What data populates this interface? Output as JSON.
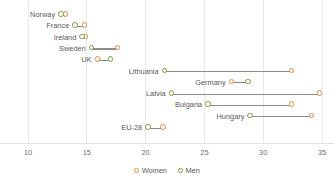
{
  "chart_data": {
    "type": "scatter",
    "title": "",
    "subtitle": "",
    "xlabel": "",
    "ylabel": "",
    "xlim": [
      9.2,
      35.5
    ],
    "grid": true,
    "legend_position": "bottom-center",
    "xticks": [
      10,
      15,
      20,
      25,
      30,
      35
    ],
    "xtick_labels": [
      "10",
      "15",
      "20",
      "25",
      "30",
      "35"
    ],
    "series": [
      {
        "name": "Women",
        "color": "#e8883a",
        "values": [
          13.2,
          14.8,
          14.9,
          17.6,
          15.9,
          32.4,
          27.3,
          34.8,
          32.4,
          34.1,
          21.5
        ]
      },
      {
        "name": "Men",
        "color": "#7a9a3a",
        "values": [
          12.8,
          14.0,
          14.6,
          15.4,
          17.0,
          21.6,
          28.7,
          22.2,
          25.3,
          28.9,
          20.2
        ]
      }
    ],
    "categories": [
      "Norway",
      "France",
      "Ireland",
      "Sweden",
      "UK",
      "Lithuania",
      "Germany",
      "Latvia",
      "Bulgaria",
      "Hungary",
      "EU-28"
    ],
    "rows": [
      {
        "label": "Norway",
        "women": 13.2,
        "men": 12.8
      },
      {
        "label": "France",
        "women": 14.8,
        "men": 14.0
      },
      {
        "label": "Ireland",
        "women": 14.9,
        "men": 14.6
      },
      {
        "label": "Sweden",
        "women": 17.6,
        "men": 15.4
      },
      {
        "label": "UK",
        "women": 15.9,
        "men": 17.0
      },
      {
        "label": "Lithuania",
        "women": 32.4,
        "men": 21.6
      },
      {
        "label": "Germany",
        "women": 27.3,
        "men": 28.7
      },
      {
        "label": "Latvia",
        "women": 34.8,
        "men": 22.2
      },
      {
        "label": "Bulgaria",
        "women": 32.4,
        "men": 25.3
      },
      {
        "label": "Hungary",
        "women": 34.1,
        "men": 28.9
      },
      {
        "label": "EU-28",
        "women": 21.5,
        "men": 20.2
      }
    ]
  },
  "legend": {
    "items": [
      {
        "label": "Women",
        "color": "#e8883a"
      },
      {
        "label": "Men",
        "color": "#7a9a3a"
      }
    ]
  },
  "colors": {
    "women": "#e8883a",
    "men": "#7a9a3a",
    "connector": "#8c8c8c",
    "gridline": "#e9e9e9",
    "text": "#58595b"
  }
}
